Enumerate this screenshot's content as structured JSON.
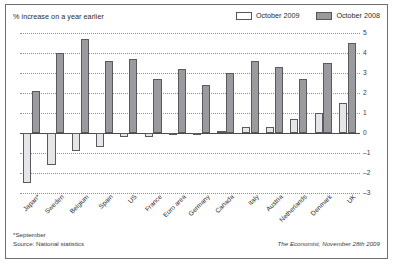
{
  "header": {
    "subtitle": "% increase on a year earlier"
  },
  "legend": {
    "position": "top-right",
    "items": [
      {
        "label": "October 2009",
        "color": "#ffffff",
        "border": "#55555a"
      },
      {
        "label": "October 2008",
        "color": "#9a9a9e",
        "border": "#55555a"
      }
    ]
  },
  "footer": {
    "footnote_line1": "*September",
    "footnote_line2": "Source: National statistics",
    "credit": "The Economist, November 28th 2009"
  },
  "chart_data": {
    "type": "bar",
    "title": "",
    "subtitle": "% increase on a year earlier",
    "xlabel": "",
    "ylabel": "% increase on a year earlier",
    "ylim": [
      -3,
      5
    ],
    "yticks": [
      5,
      4,
      3,
      2,
      1,
      0,
      -1,
      -2,
      -3
    ],
    "grid": true,
    "legend_position": "top-right",
    "categories": [
      "Japan*",
      "Sweden",
      "Belgium",
      "Spain",
      "US",
      "France",
      "Euro area",
      "Germany",
      "Canada",
      "Italy",
      "Austria",
      "Netherlands",
      "Denmark",
      "UK"
    ],
    "series": [
      {
        "name": "October 2009",
        "color": "#e6e6e6",
        "values": [
          -2.5,
          -1.6,
          -0.9,
          -0.7,
          -0.2,
          -0.2,
          -0.1,
          -0.1,
          0.1,
          0.3,
          0.3,
          0.7,
          1.0,
          1.5
        ]
      },
      {
        "name": "October 2008",
        "color": "#9b9b9f",
        "values": [
          2.1,
          4.0,
          4.7,
          3.6,
          3.7,
          2.7,
          3.2,
          2.4,
          3.0,
          3.6,
          3.3,
          2.7,
          3.5,
          4.5
        ]
      }
    ],
    "annotations": [
      "*September",
      "Source: National statistics",
      "The Economist, November 28th 2009"
    ]
  }
}
